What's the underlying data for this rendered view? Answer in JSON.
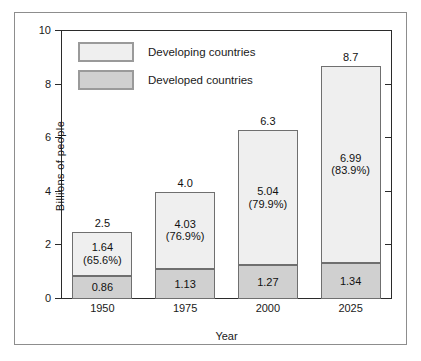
{
  "chart_data": {
    "type": "bar",
    "subtype": "stacked-bar",
    "title": "",
    "xlabel": "Year",
    "ylabel": "Billions of people",
    "categories": [
      "1950",
      "1975",
      "2000",
      "2025"
    ],
    "ylim": [
      0,
      10
    ],
    "yticks": [
      0,
      2,
      4,
      6,
      8,
      10
    ],
    "ytick_labels": [
      "0",
      "2",
      "4",
      "6",
      "8",
      "10"
    ],
    "grid": false,
    "legend_position": "upper-left-inside",
    "series": [
      {
        "name": "Developed countries",
        "color": "#d0d0d0",
        "values": [
          0.86,
          1.13,
          1.27,
          1.34
        ],
        "labels": [
          "0.86",
          "1.13",
          "1.27",
          "1.34"
        ]
      },
      {
        "name": "Developing countries",
        "color": "#efefef",
        "values": [
          1.64,
          4.03,
          5.04,
          6.99
        ],
        "labels": [
          "1.64",
          "4.03",
          "5.04",
          "6.99"
        ],
        "percent_labels": [
          "(65.6%)",
          "(76.9%)",
          "(79.9%)",
          "(83.9%)"
        ]
      }
    ],
    "totals": [
      2.5,
      4.0,
      6.3,
      8.7
    ],
    "total_labels": [
      "2.5",
      "4.0",
      "6.3",
      "8.7"
    ]
  },
  "axes": {
    "ytitle": "Billions of people",
    "xtitle": "Year",
    "yticks": [
      {
        "label": "10",
        "value": 10
      },
      {
        "label": "8",
        "value": 8
      },
      {
        "label": "6",
        "value": 6
      },
      {
        "label": "4",
        "value": 4
      },
      {
        "label": "2",
        "value": 2
      },
      {
        "label": "0",
        "value": 0
      }
    ],
    "xticks": [
      {
        "label": "1950"
      },
      {
        "label": "1975"
      },
      {
        "label": "2000"
      },
      {
        "label": "2025"
      }
    ]
  },
  "legend": {
    "items": [
      {
        "label": "Developing countries",
        "color": "#efefef"
      },
      {
        "label": "Developed countries",
        "color": "#d0d0d0"
      }
    ]
  },
  "bars": [
    {
      "category": "1950",
      "total_label": "2.5",
      "developing_label": "1.64",
      "developing_percent": "(65.6%)",
      "developed_label": "0.86"
    },
    {
      "category": "1975",
      "total_label": "4.0",
      "developing_label": "4.03",
      "developing_percent": "(76.9%)",
      "developed_label": "1.13"
    },
    {
      "category": "2000",
      "total_label": "6.3",
      "developing_label": "5.04",
      "developing_percent": "(79.9%)",
      "developed_label": "1.27"
    },
    {
      "category": "2025",
      "total_label": "8.7",
      "developing_label": "6.99",
      "developing_percent": "(83.9%)",
      "developed_label": "1.34"
    }
  ]
}
